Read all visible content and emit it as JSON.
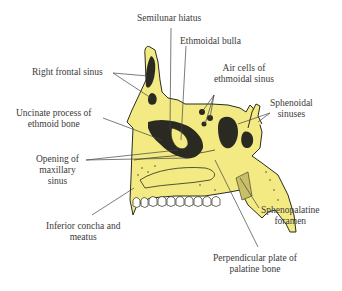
{
  "diagram": {
    "colors": {
      "bone": "#F3EA84",
      "cavity": "#2a2a22",
      "outline": "#2b2b20",
      "leader": "#444444",
      "teeth": "#ffffff",
      "background": "#ffffff"
    },
    "labels": {
      "semilunar_hiatus": "Semilunar hiatus",
      "ethmoidal_bulla": "Ethmoidal bulla",
      "right_frontal_sinus": "Right frontal sinus",
      "air_cells_line1": "Air cells of",
      "air_cells_line2": "ethmoidal sinus",
      "sphenoidal_line1": "Sphenoidal",
      "sphenoidal_line2": "sinuses",
      "uncinate_line1": "Uncinate process of",
      "uncinate_line2": "ethmoid bone",
      "opening_line1": "Opening of",
      "opening_line2": "maxillary",
      "opening_line3": "sinus",
      "inferior_line1": "Inferior concha and",
      "inferior_line2": "meatus",
      "sphenopalatine_line1": "Sphenopalatine",
      "sphenopalatine_line2": "foramen",
      "perpendicular_line1": "Perpendicular plate of",
      "perpendicular_line2": "palatine bone"
    }
  }
}
